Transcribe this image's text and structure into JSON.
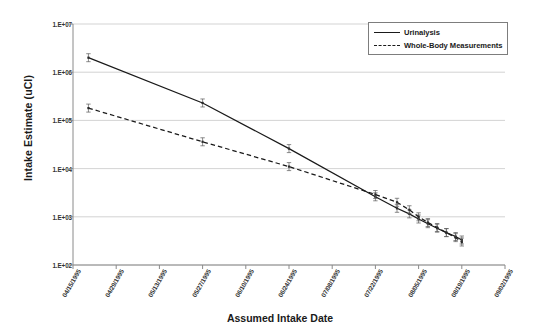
{
  "chart_data": {
    "type": "line",
    "title": "",
    "xlabel": "Assumed Intake Date",
    "ylabel": "Intake Estimate (uCI)",
    "yscale": "log",
    "ylim": [
      100,
      10000000
    ],
    "ytick_labels": [
      "1.E+07",
      "1.E+06",
      "1.E+05",
      "1.E+04",
      "1.E+03",
      "1.E+02"
    ],
    "ytick_values": [
      10000000,
      1000000,
      100000,
      10000,
      1000,
      100
    ],
    "xtick_labels": [
      "04/15/1995",
      "04/29/1995",
      "05/13/1995",
      "05/27/1995",
      "06/10/1995",
      "06/24/1995",
      "07/08/1995",
      "07/22/1995",
      "08/05/1995",
      "08/19/1995",
      "09/02/1995"
    ],
    "grid": true,
    "legend_position": "top-right",
    "legend_entries": [
      "Urinalysis",
      "Whole-Body Measurements"
    ],
    "series": [
      {
        "name": "Urinalysis",
        "style": "solid",
        "color": "#1a1a1a",
        "error_bars": true,
        "points": [
          {
            "date": "04/20/1995",
            "value": 2000000
          },
          {
            "date": "05/27/1995",
            "value": 230000
          },
          {
            "date": "06/24/1995",
            "value": 26000
          },
          {
            "date": "07/22/1995",
            "value": 2600
          },
          {
            "date": "07/29/1995",
            "value": 1500
          },
          {
            "date": "08/02/1995",
            "value": 1150
          },
          {
            "date": "08/05/1995",
            "value": 900
          },
          {
            "date": "08/08/1995",
            "value": 720
          },
          {
            "date": "08/11/1995",
            "value": 580
          },
          {
            "date": "08/14/1995",
            "value": 470
          },
          {
            "date": "08/17/1995",
            "value": 390
          },
          {
            "date": "08/19/1995",
            "value": 330
          }
        ]
      },
      {
        "name": "Whole-Body Measurements",
        "style": "dashed",
        "color": "#1a1a1a",
        "error_bars": true,
        "points": [
          {
            "date": "04/20/1995",
            "value": 180000
          },
          {
            "date": "05/27/1995",
            "value": 36000
          },
          {
            "date": "06/24/1995",
            "value": 11000
          },
          {
            "date": "07/22/1995",
            "value": 2900
          },
          {
            "date": "07/29/1995",
            "value": 2000
          },
          {
            "date": "08/02/1995",
            "value": 1400
          },
          {
            "date": "08/05/1995",
            "value": 1000
          },
          {
            "date": "08/08/1995",
            "value": 760
          },
          {
            "date": "08/11/1995",
            "value": 600
          },
          {
            "date": "08/14/1995",
            "value": 470
          },
          {
            "date": "08/17/1995",
            "value": 370
          },
          {
            "date": "08/19/1995",
            "value": 300
          }
        ]
      }
    ]
  },
  "axes": {
    "ylabel": "Intake Estimate (uCI)",
    "xlabel": "Assumed Intake Date"
  },
  "legend": {
    "items": [
      {
        "label": "Urinalysis"
      },
      {
        "label": "Whole-Body Measurements"
      }
    ]
  }
}
